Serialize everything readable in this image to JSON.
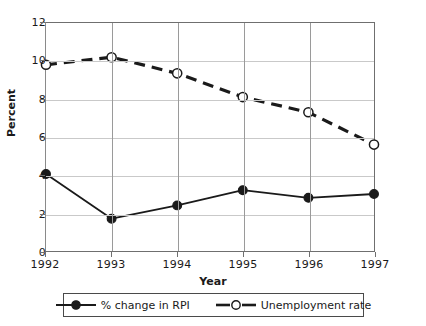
{
  "chart_data": {
    "type": "line",
    "title": "",
    "xlabel": "Year",
    "ylabel": "Percent",
    "categories": [
      "1992",
      "1993",
      "1994",
      "1995",
      "1996",
      "1997"
    ],
    "ylim": [
      0,
      12
    ],
    "yticks": [
      0,
      2,
      4,
      6,
      8,
      10,
      12
    ],
    "ytick_labels": [
      "0",
      "2",
      "4",
      "6",
      "8",
      "10",
      "12"
    ],
    "grid": true,
    "legend_position": "bottom",
    "series": [
      {
        "name": "% change in RPI",
        "values": [
          4.05,
          1.7,
          2.4,
          3.2,
          2.8,
          3.0
        ],
        "style": "solid",
        "marker": "filled-circle",
        "color": "#1a1a1a"
      },
      {
        "name": "Unemployment rate",
        "values": [
          9.8,
          10.2,
          9.35,
          8.1,
          7.3,
          5.6
        ],
        "style": "dashed",
        "marker": "open-circle",
        "color": "#1a1a1a"
      }
    ]
  },
  "axes": {
    "ylabel": "Percent",
    "xlabel": "Year",
    "ytick_labels": [
      "0",
      "2",
      "4",
      "6",
      "8",
      "10",
      "12"
    ],
    "xtick_labels": [
      "1992",
      "1993",
      "1994",
      "1995",
      "1996",
      "1997"
    ]
  },
  "legend": {
    "entries": [
      {
        "label": "% change in RPI"
      },
      {
        "label": "Unemployment rate"
      }
    ]
  }
}
